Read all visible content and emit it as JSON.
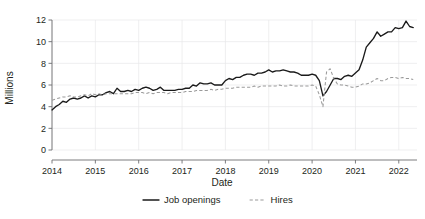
{
  "chart_data": {
    "type": "line",
    "title": "",
    "xlabel": "Date",
    "ylabel": "Millions",
    "xlim": [
      2014.0,
      2022.42
    ],
    "ylim": [
      0,
      12
    ],
    "yticks": [
      0,
      2,
      4,
      6,
      8,
      10,
      12
    ],
    "xticks": [
      2014,
      2015,
      2016,
      2017,
      2018,
      2019,
      2020,
      2021,
      2022
    ],
    "xtick_labels": [
      "2014",
      "2015",
      "2016",
      "2017",
      "2018",
      "2019",
      "2020",
      "2021",
      "2022"
    ],
    "ytick_labels": [
      "0",
      "2",
      "4",
      "6",
      "8",
      "10",
      "12"
    ],
    "grid": true,
    "legend_position": "bottom",
    "x": [
      2014.0,
      2014.083,
      2014.167,
      2014.25,
      2014.333,
      2014.417,
      2014.5,
      2014.583,
      2014.667,
      2014.75,
      2014.833,
      2014.917,
      2015.0,
      2015.083,
      2015.167,
      2015.25,
      2015.333,
      2015.417,
      2015.5,
      2015.583,
      2015.667,
      2015.75,
      2015.833,
      2015.917,
      2016.0,
      2016.083,
      2016.167,
      2016.25,
      2016.333,
      2016.417,
      2016.5,
      2016.583,
      2016.667,
      2016.75,
      2016.833,
      2016.917,
      2017.0,
      2017.083,
      2017.167,
      2017.25,
      2017.333,
      2017.417,
      2017.5,
      2017.583,
      2017.667,
      2017.75,
      2017.833,
      2017.917,
      2018.0,
      2018.083,
      2018.167,
      2018.25,
      2018.333,
      2018.417,
      2018.5,
      2018.583,
      2018.667,
      2018.75,
      2018.833,
      2018.917,
      2019.0,
      2019.083,
      2019.167,
      2019.25,
      2019.333,
      2019.417,
      2019.5,
      2019.583,
      2019.667,
      2019.75,
      2019.833,
      2019.917,
      2020.0,
      2020.083,
      2020.167,
      2020.25,
      2020.333,
      2020.417,
      2020.5,
      2020.583,
      2020.667,
      2020.75,
      2020.833,
      2020.917,
      2021.0,
      2021.083,
      2021.167,
      2021.25,
      2021.333,
      2021.417,
      2021.5,
      2021.583,
      2021.667,
      2021.75,
      2021.833,
      2021.917,
      2022.0,
      2022.083,
      2022.167,
      2022.25,
      2022.333
    ],
    "series": [
      {
        "name": "Job openings",
        "style": "solid",
        "color": "#1a1a1a",
        "values": [
          3.7,
          4.0,
          4.2,
          4.5,
          4.4,
          4.7,
          4.8,
          4.7,
          4.8,
          5.0,
          4.8,
          5.0,
          4.9,
          5.1,
          5.1,
          5.3,
          5.4,
          5.2,
          5.7,
          5.4,
          5.4,
          5.5,
          5.4,
          5.6,
          5.5,
          5.7,
          5.8,
          5.7,
          5.5,
          5.6,
          5.8,
          5.5,
          5.5,
          5.5,
          5.5,
          5.6,
          5.6,
          5.7,
          5.7,
          6.0,
          5.9,
          6.2,
          6.1,
          6.1,
          6.2,
          6.0,
          6.0,
          6.0,
          6.4,
          6.6,
          6.5,
          6.7,
          6.7,
          6.9,
          7.0,
          7.0,
          6.9,
          7.1,
          7.1,
          7.2,
          7.4,
          7.2,
          7.3,
          7.3,
          7.4,
          7.3,
          7.2,
          7.2,
          7.1,
          6.9,
          6.9,
          6.9,
          7.0,
          6.9,
          6.4,
          5.0,
          5.4,
          6.0,
          6.6,
          6.6,
          6.5,
          6.8,
          6.9,
          6.8,
          7.1,
          7.4,
          8.3,
          9.5,
          9.9,
          10.3,
          10.9,
          10.5,
          10.7,
          10.9,
          10.9,
          11.3,
          11.2,
          11.3,
          11.9,
          11.4,
          11.3
        ]
      },
      {
        "name": "Hires",
        "style": "dashed",
        "color": "#9a9a9a",
        "values": [
          4.6,
          4.7,
          4.8,
          4.9,
          4.9,
          5.0,
          4.9,
          4.9,
          5.0,
          5.1,
          5.0,
          5.2,
          5.1,
          5.2,
          5.1,
          5.2,
          5.2,
          5.2,
          5.2,
          5.2,
          5.2,
          5.2,
          5.2,
          5.3,
          5.3,
          5.3,
          5.2,
          5.3,
          5.2,
          5.3,
          5.3,
          5.3,
          5.2,
          5.3,
          5.3,
          5.3,
          5.3,
          5.4,
          5.4,
          5.4,
          5.5,
          5.5,
          5.5,
          5.5,
          5.6,
          5.5,
          5.6,
          5.6,
          5.7,
          5.7,
          5.7,
          5.8,
          5.8,
          5.8,
          5.8,
          5.8,
          5.9,
          5.8,
          5.9,
          5.9,
          5.9,
          5.9,
          5.9,
          6.0,
          5.9,
          5.9,
          6.0,
          5.9,
          5.9,
          5.9,
          5.9,
          5.9,
          6.0,
          5.9,
          5.1,
          4.0,
          7.2,
          7.5,
          6.6,
          6.1,
          6.0,
          6.0,
          5.9,
          5.8,
          5.8,
          5.9,
          6.1,
          6.1,
          6.2,
          6.4,
          6.6,
          6.4,
          6.4,
          6.6,
          6.7,
          6.7,
          6.6,
          6.7,
          6.6,
          6.6,
          6.5
        ]
      }
    ],
    "legend": [
      {
        "label": "Job openings",
        "style": "solid"
      },
      {
        "label": "Hires",
        "style": "dashed"
      }
    ]
  }
}
